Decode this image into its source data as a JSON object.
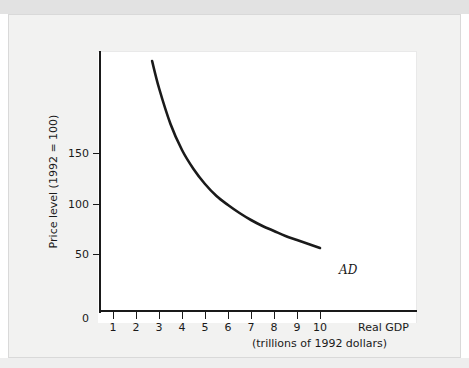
{
  "figure": {
    "background_color": "#f2f2f1",
    "panel_color": "#ffffff",
    "axis_color": "#1a1a1a",
    "curve_color": "#1a1a1a"
  },
  "axes": {
    "origin_label": "0",
    "y_axis_title": "Price level (1992 = 100)",
    "y_ticks": [
      "50",
      "100",
      "150"
    ],
    "x_ticks": [
      "1",
      "2",
      "3",
      "4",
      "5",
      "6",
      "7",
      "8",
      "9",
      "10"
    ],
    "x_axis_title_line1": "Real GDP",
    "x_axis_title_line2": "(trillions of 1992 dollars)"
  },
  "annotations": {
    "curve_label": "AD"
  },
  "chart_data": {
    "type": "line",
    "title": "",
    "xlabel": "Real GDP (trillions of 1992 dollars)",
    "ylabel": "Price level (1992 = 100)",
    "xlim": [
      0,
      13.8
    ],
    "ylim": [
      0,
      260
    ],
    "grid": false,
    "legend_position": "inline-right-end",
    "series": [
      {
        "name": "AD",
        "x": [
          2.7,
          3.0,
          3.5,
          4.0,
          4.5,
          5.0,
          5.5,
          6.0,
          6.5,
          7.0,
          7.5,
          8.0,
          8.5,
          9.0,
          9.5,
          10.0
        ],
        "y": [
          235,
          208,
          172,
          146,
          127,
          112,
          100,
          91,
          83,
          76,
          70,
          65,
          60,
          56,
          52,
          48
        ]
      }
    ],
    "y_tick_values": [
      50,
      100,
      150
    ],
    "x_tick_values": [
      1,
      2,
      3,
      4,
      5,
      6,
      7,
      8,
      9,
      10
    ]
  }
}
